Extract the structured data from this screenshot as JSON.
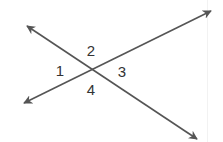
{
  "diagram": {
    "type": "intersecting-lines",
    "line_color": "#555555",
    "label_color": "#333333",
    "intersection": {
      "x": 92,
      "y": 70
    },
    "lines": [
      {
        "name": "line-a",
        "from": {
          "x": 24,
          "y": 103
        },
        "to": {
          "x": 211,
          "y": 11
        },
        "arrows": "both"
      },
      {
        "name": "line-b",
        "from": {
          "x": 27,
          "y": 26
        },
        "to": {
          "x": 197,
          "y": 139
        },
        "arrows": "both"
      }
    ],
    "angle_labels": [
      {
        "id": "1",
        "text": "1",
        "x": 60,
        "y": 76
      },
      {
        "id": "2",
        "text": "2",
        "x": 91,
        "y": 56
      },
      {
        "id": "3",
        "text": "3",
        "x": 122,
        "y": 77
      },
      {
        "id": "4",
        "text": "4",
        "x": 91,
        "y": 95
      }
    ]
  }
}
